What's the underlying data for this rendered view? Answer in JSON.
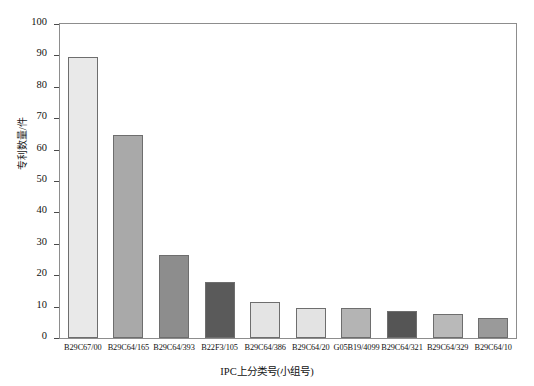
{
  "chart_data": {
    "type": "bar",
    "title": "",
    "xlabel": "IPC上分类号(小组号)",
    "ylabel": "专利数量/件",
    "ylim": [
      0,
      100
    ],
    "ytick_interval": 10,
    "yticks": [
      0,
      10,
      20,
      30,
      40,
      50,
      60,
      70,
      80,
      90,
      100
    ],
    "grid": false,
    "legend": "none",
    "categories": [
      "B29C67/00",
      "B29C64/165",
      "B29C64/393",
      "B22F3/105",
      "B29C64/386",
      "B29C64/20",
      "G05B19/4099",
      "B29C64/321",
      "B29C64/329",
      "B29C64/10"
    ],
    "values": [
      89.5,
      64.5,
      26.5,
      17.8,
      11.5,
      9.5,
      9.5,
      8.5,
      7.5,
      6.5
    ],
    "bar_colors": [
      "#e9e9e9",
      "#a9a9a9",
      "#8d8d8d",
      "#5a5a5a",
      "#e4e4e4",
      "#e3e3e3",
      "#b4b4b4",
      "#555555",
      "#b9b9b9",
      "#9a9a9a"
    ],
    "bar_edge_color": "#6e6e6e",
    "axis_color": "#8d8d8d",
    "background": "#ffffff"
  }
}
